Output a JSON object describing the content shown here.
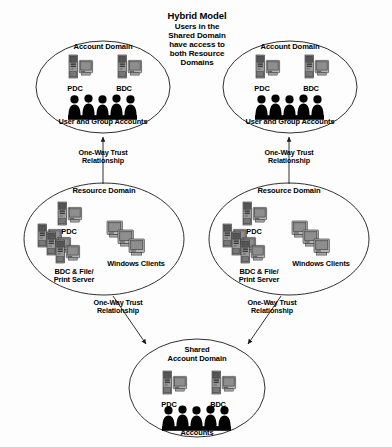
{
  "title": {
    "main": "Hybrid Model",
    "subtitle": "Users in the\nShared Domain\nhave access to\nboth Resource\nDomains"
  },
  "colors": {
    "background": "#fdfdfd",
    "outline": "#1a1a1a",
    "silhouette": "#000000",
    "icon_dark": "#4a4a4a",
    "icon_light": "#bdbdbd",
    "screen": "#8c8c8c"
  },
  "domains": [
    {
      "id": "account-domain-left",
      "title": "Account Domain",
      "nodes": [
        {
          "label": "PDC",
          "icon": "server-computer-icon"
        },
        {
          "label": "BDC",
          "icon": "server-computer-icon"
        }
      ],
      "base_label": "User and Group Accounts",
      "base_icon": "people-group-icon"
    },
    {
      "id": "account-domain-right",
      "title": "Account Domain",
      "nodes": [
        {
          "label": "PDC",
          "icon": "server-computer-icon"
        },
        {
          "label": "BDC",
          "icon": "server-computer-icon"
        }
      ],
      "base_label": "User and Group Accounts",
      "base_icon": "people-group-icon"
    },
    {
      "id": "resource-domain-left",
      "title": "Resource Domain",
      "nodes": [
        {
          "label": "PDC",
          "icon": "server-computer-icon"
        },
        {
          "label": "BDC & File/\nPrint Server",
          "icon": "server-stack-icon"
        },
        {
          "label": "Windows Clients",
          "icon": "client-stack-icon"
        }
      ]
    },
    {
      "id": "resource-domain-right",
      "title": "Resource Domain",
      "nodes": [
        {
          "label": "PDC",
          "icon": "server-computer-icon"
        },
        {
          "label": "BDC & File/\nPrint Server",
          "icon": "server-stack-icon"
        },
        {
          "label": "Windows Clients",
          "icon": "client-stack-icon"
        }
      ]
    },
    {
      "id": "shared-account-domain",
      "title": "Shared\nAccount Domain",
      "nodes": [
        {
          "label": "PDC",
          "icon": "server-computer-icon"
        },
        {
          "label": "BDC",
          "icon": "server-computer-icon"
        }
      ],
      "base_label": "Accounts",
      "base_icon": "people-group-icon"
    }
  ],
  "trust_arrows": [
    {
      "id": "trust-res-left-to-acct-left",
      "label": "One-Way Trust\nRelationship",
      "direction": "up"
    },
    {
      "id": "trust-res-right-to-acct-right",
      "label": "One-Way Trust\nRelationship",
      "direction": "up"
    },
    {
      "id": "trust-res-left-to-shared",
      "label": "One-Way Trust\nRelationship",
      "direction": "down-right"
    },
    {
      "id": "trust-res-right-to-shared",
      "label": "One-Way Trust\nRelationship",
      "direction": "down-left"
    }
  ]
}
